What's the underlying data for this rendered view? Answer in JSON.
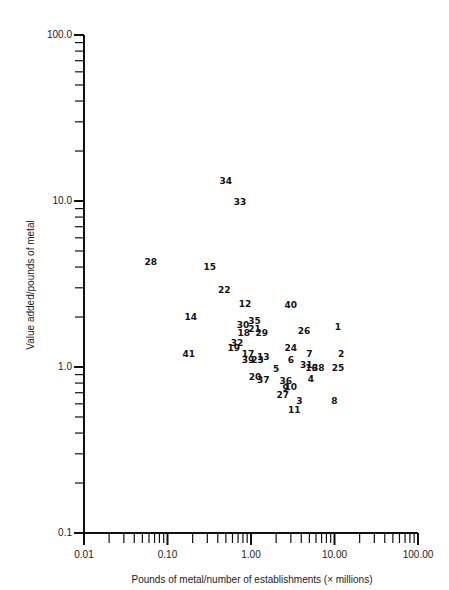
{
  "chart_data": {
    "type": "scatter",
    "title": "",
    "xlabel": "Pounds of metal/number of establishments (× millions)",
    "ylabel": "Value added/pounds of metal",
    "xscale": "log",
    "yscale": "log",
    "xlim": [
      0.01,
      100
    ],
    "ylim": [
      0.1,
      100
    ],
    "x_tick_labels": [
      "0.01",
      "0.10",
      "1.00",
      "10.00",
      "100.00"
    ],
    "y_tick_labels": [
      "0.1",
      "1.0",
      "10.0",
      "100.0"
    ],
    "grid": false,
    "legend": null,
    "marker": "numeric labels",
    "points": [
      {
        "label": "1",
        "x": 11.0,
        "y": 1.75
      },
      {
        "label": "2",
        "x": 12.0,
        "y": 1.2
      },
      {
        "label": "3",
        "x": 3.8,
        "y": 0.62
      },
      {
        "label": "4",
        "x": 5.2,
        "y": 0.85
      },
      {
        "label": "5",
        "x": 2.0,
        "y": 0.97
      },
      {
        "label": "6",
        "x": 3.0,
        "y": 1.1
      },
      {
        "label": "7",
        "x": 5.0,
        "y": 1.2
      },
      {
        "label": "8",
        "x": 10.0,
        "y": 0.62
      },
      {
        "label": "9",
        "x": 2.6,
        "y": 0.75
      },
      {
        "label": "10",
        "x": 3.0,
        "y": 0.76
      },
      {
        "label": "11",
        "x": 3.3,
        "y": 0.55
      },
      {
        "label": "12",
        "x": 0.85,
        "y": 2.4
      },
      {
        "label": "13",
        "x": 1.4,
        "y": 1.15
      },
      {
        "label": "14",
        "x": 0.19,
        "y": 2.0
      },
      {
        "label": "15",
        "x": 0.32,
        "y": 4.0
      },
      {
        "label": "16",
        "x": 5.3,
        "y": 0.98
      },
      {
        "label": "17",
        "x": 0.92,
        "y": 1.2
      },
      {
        "label": "18",
        "x": 0.82,
        "y": 1.6
      },
      {
        "label": "19",
        "x": 0.62,
        "y": 1.3
      },
      {
        "label": "20",
        "x": 1.12,
        "y": 0.87
      },
      {
        "label": "21",
        "x": 1.1,
        "y": 1.7
      },
      {
        "label": "22",
        "x": 0.48,
        "y": 2.9
      },
      {
        "label": "23",
        "x": 1.2,
        "y": 1.1
      },
      {
        "label": "24",
        "x": 3.0,
        "y": 1.3
      },
      {
        "label": "25",
        "x": 11.0,
        "y": 0.98
      },
      {
        "label": "26",
        "x": 4.3,
        "y": 1.65
      },
      {
        "label": "27",
        "x": 2.4,
        "y": 0.68
      },
      {
        "label": "28",
        "x": 0.063,
        "y": 4.3
      },
      {
        "label": "29",
        "x": 1.35,
        "y": 1.6
      },
      {
        "label": "30",
        "x": 0.8,
        "y": 1.8
      },
      {
        "label": "31",
        "x": 4.6,
        "y": 1.03
      },
      {
        "label": "32",
        "x": 0.68,
        "y": 1.4
      },
      {
        "label": "33",
        "x": 0.74,
        "y": 9.8
      },
      {
        "label": "34",
        "x": 0.5,
        "y": 13.2
      },
      {
        "label": "35",
        "x": 1.1,
        "y": 1.9
      },
      {
        "label": "36",
        "x": 2.6,
        "y": 0.82
      },
      {
        "label": "37",
        "x": 1.4,
        "y": 0.84
      },
      {
        "label": "38",
        "x": 6.4,
        "y": 0.98
      },
      {
        "label": "39",
        "x": 0.92,
        "y": 1.1
      },
      {
        "label": "40",
        "x": 3.0,
        "y": 2.35
      },
      {
        "label": "41",
        "x": 0.18,
        "y": 1.2
      }
    ]
  }
}
